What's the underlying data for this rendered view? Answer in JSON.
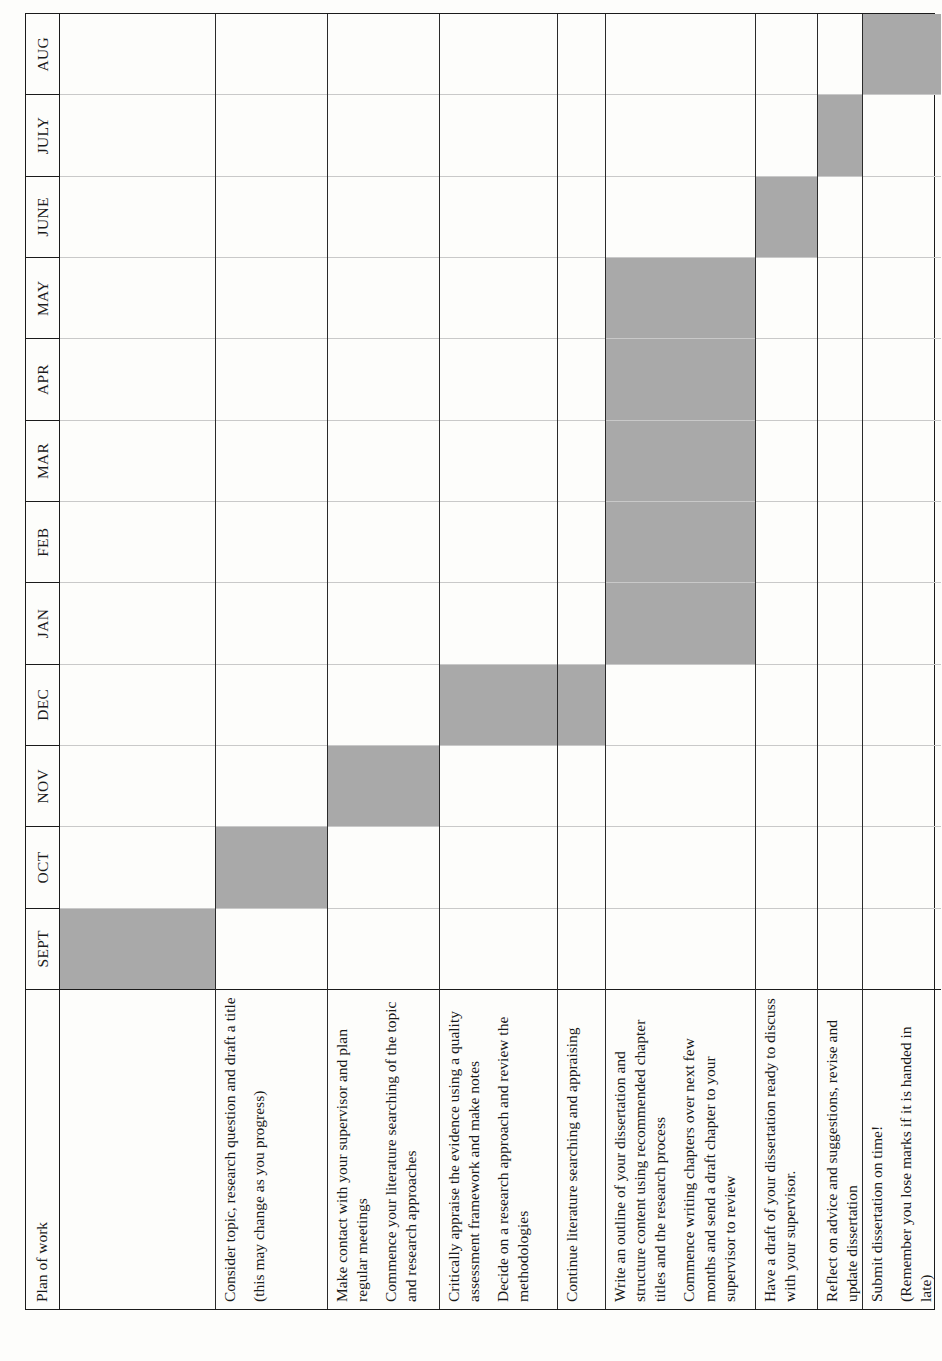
{
  "document": {
    "kind": "gantt-plan-of-work-table",
    "orientation_note": "table printed sideways on the page"
  },
  "table": {
    "corner_label": "Plan of work",
    "months": [
      "SEPT",
      "OCT",
      "NOV",
      "DEC",
      "JAN",
      "FEB",
      "MAR",
      "APR",
      "MAY",
      "JUNE",
      "JULY",
      "AUG"
    ]
  },
  "chart_data": {
    "type": "bar",
    "title": "Plan of work",
    "xlabel": "",
    "ylabel": "",
    "categories": [
      "SEPT",
      "OCT",
      "NOV",
      "DEC",
      "JAN",
      "FEB",
      "MAR",
      "APR",
      "MAY",
      "JUNE",
      "JULY",
      "AUG"
    ],
    "rows": [
      {
        "task": "Read module guidelines so you know exactly what is expected. Design plan and time chart for research and activities",
        "lines": [
          "Read module guidelines so you know",
          "exactly what is expected. Design plan",
          "and time chart for research and",
          "activities"
        ],
        "months": [
          "SEPT"
        ],
        "filled": [
          1,
          0,
          0,
          0,
          0,
          0,
          0,
          0,
          0,
          0,
          0,
          0
        ]
      },
      {
        "task": "Consider topic, research question and draft a title (this may change as you progress)",
        "lines": [
          "Consider topic, research question and",
          "draft a title",
          "(this may change as you progress)"
        ],
        "paragraphs": [
          "Consider topic, research question and draft a title",
          "(this may change as you progress)"
        ],
        "months": [
          "OCT"
        ],
        "filled": [
          0,
          1,
          0,
          0,
          0,
          0,
          0,
          0,
          0,
          0,
          0,
          0
        ]
      },
      {
        "task": "Make contact with your supervisor and plan regular meetings. Commence your literature searching of the topic and research approaches",
        "paragraphs": [
          "Make contact with your supervisor and plan regular meetings",
          "Commence your literature searching of the topic and research approaches"
        ],
        "months": [
          "NOV"
        ],
        "filled": [
          0,
          0,
          1,
          0,
          0,
          0,
          0,
          0,
          0,
          0,
          0,
          0
        ]
      },
      {
        "task": "Critically appraise the evidence using a quality assessment framework and make notes. Decide on a research approach and review the methodologies",
        "paragraphs": [
          "Critically appraise the evidence using a quality assessment framework and make notes",
          "Decide on a research approach and review the methodologies"
        ],
        "months": [
          "DEC"
        ],
        "filled": [
          0,
          0,
          0,
          1,
          0,
          0,
          0,
          0,
          0,
          0,
          0,
          0
        ]
      },
      {
        "task": "Continue literature searching and appraising",
        "paragraphs": [
          "Continue literature searching and appraising"
        ],
        "months": [
          "DEC"
        ],
        "filled": [
          0,
          0,
          0,
          1,
          0,
          0,
          0,
          0,
          0,
          0,
          0,
          0
        ]
      },
      {
        "task": "Write an outline of your dissertation and structure content using recommended chapter titles and the research process. Commence writing chapters over next few months and send a draft chapter to your supervisor to review",
        "paragraphs": [
          "Write an outline of your dissertation and structure content using recommended chapter titles and the research process",
          "Commence writing chapters over next few months and send a draft chapter to your supervisor to review"
        ],
        "months": [
          "JAN",
          "FEB",
          "MAR",
          "APR",
          "MAY"
        ],
        "filled": [
          0,
          0,
          0,
          0,
          1,
          1,
          1,
          1,
          1,
          0,
          0,
          0
        ]
      },
      {
        "task": "Have a draft of your dissertation ready to discuss with your supervisor.",
        "paragraphs": [
          "Have a draft of your dissertation ready to discuss with your supervisor."
        ],
        "months": [
          "JUNE"
        ],
        "filled": [
          0,
          0,
          0,
          0,
          0,
          0,
          0,
          0,
          0,
          1,
          0,
          0
        ]
      },
      {
        "task": "Reflect on advice and suggestions, revise and update dissertation",
        "paragraphs": [
          "Reflect on advice and suggestions, revise and update dissertation"
        ],
        "months": [
          "JULY"
        ],
        "filled": [
          0,
          0,
          0,
          0,
          0,
          0,
          0,
          0,
          0,
          0,
          1,
          0
        ]
      },
      {
        "task": "Submit dissertation on time! (Remember you lose marks if it is handed in late)",
        "paragraphs": [
          "Submit dissertation on time!",
          "(Remember you lose marks if it is handed in late)"
        ],
        "months": [
          "AUG"
        ],
        "filled": [
          0,
          0,
          0,
          0,
          0,
          0,
          0,
          0,
          0,
          0,
          0,
          1
        ]
      }
    ],
    "legend": [],
    "grid": true,
    "fill_color": "#a9a9a9",
    "border_color": "#1b1b1b"
  }
}
